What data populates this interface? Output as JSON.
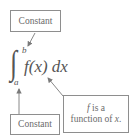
{
  "diagram": {
    "top_label": "Constant",
    "bottom_label": "Constant",
    "function_note": {
      "line1_var": "f",
      "line1_rest": " is a",
      "line2_text": "function of ",
      "line2_var": "x",
      "line2_end": "."
    },
    "integral": {
      "sign": "∫",
      "upper_limit": "b",
      "lower_limit": "a",
      "integrand": "f(x) dx"
    },
    "colors": {
      "border": "#8e8e8e",
      "text": "#5a5a5a",
      "arrow": "#7a7a7a"
    }
  }
}
